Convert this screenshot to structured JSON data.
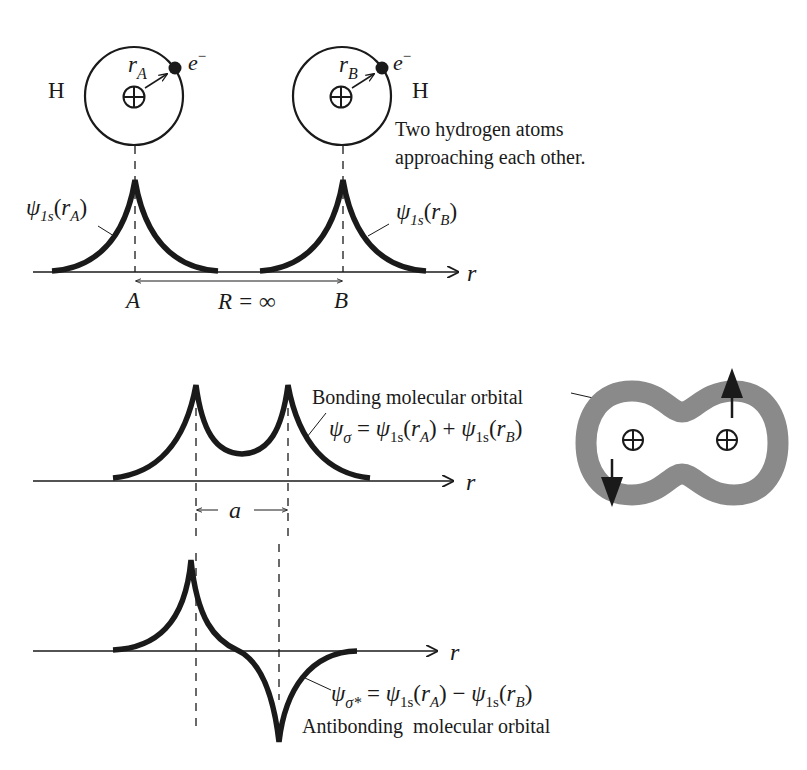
{
  "colors": {
    "ink": "#1a1a1a",
    "orbital_gray": "#8a8a8a",
    "background": "#ffffff"
  },
  "top_panel": {
    "atom_a": {
      "symbol": "H",
      "radius_label": "r",
      "radius_sub": "A",
      "electron": "e",
      "electron_sup": "−"
    },
    "atom_b": {
      "symbol": "H",
      "radius_label": "r",
      "radius_sub": "B",
      "electron": "e",
      "electron_sup": "−"
    },
    "caption_line1": "Two hydrogen atoms",
    "caption_line2": "approaching each other.",
    "psi_a": {
      "psi": "ψ",
      "sub": "1s",
      "open": "(",
      "r": "r",
      "r_sub": "A",
      "close": ")"
    },
    "psi_b": {
      "psi": "ψ",
      "sub": "1s",
      "open": "(",
      "r": "r",
      "r_sub": "B",
      "close": ")"
    },
    "axis_label": "r",
    "label_a": "A",
    "label_b": "B",
    "separation": "R = ∞"
  },
  "middle_panel": {
    "title": "Bonding molecular orbital",
    "equation": {
      "psi": "ψ",
      "sub": "σ",
      "eq": " = ",
      "t1": "ψ",
      "t1_sub": "1s",
      "t1_arg_open": "(",
      "t1_r": "r",
      "t1_r_sub": "A",
      "t1_arg_close": ")",
      "op": " + ",
      "t2": "ψ",
      "t2_sub": "1s",
      "t2_arg_open": "(",
      "t2_r": "r",
      "t2_r_sub": "B",
      "t2_arg_close": ")"
    },
    "axis_label": "r",
    "spacing_label": "a"
  },
  "bottom_panel": {
    "title": "Antibonding  molecular orbital",
    "equation": {
      "psi": "ψ",
      "sub": "σ*",
      "eq": " = ",
      "t1": "ψ",
      "t1_sub": "1s",
      "t1_arg_open": "(",
      "t1_r": "r",
      "t1_r_sub": "A",
      "t1_arg_close": ")",
      "op": " − ",
      "t2": "ψ",
      "t2_sub": "1s",
      "t2_arg_open": "(",
      "t2_r": "r",
      "t2_r_sub": "B",
      "t2_arg_close": ")"
    },
    "axis_label": "r"
  }
}
